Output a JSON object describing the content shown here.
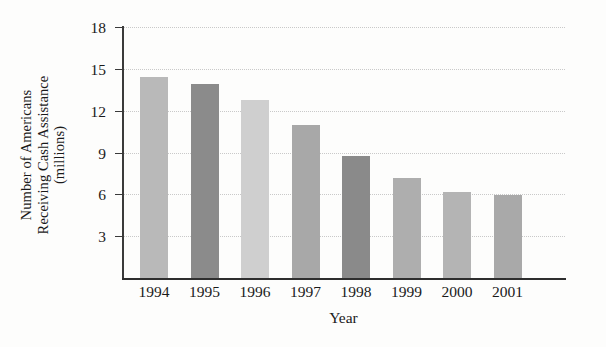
{
  "chart_data": {
    "type": "bar",
    "title": "",
    "xlabel": "Year",
    "ylabel": "Number of Americans Receiving Cash Assistance (millions)",
    "ylabel_lines": [
      "Number of Americans",
      "Receiving Cash Assistance",
      "(millions)"
    ],
    "categories": [
      "1994",
      "1995",
      "1996",
      "1997",
      "1998",
      "1999",
      "2000",
      "2001"
    ],
    "values": [
      14.4,
      13.9,
      12.8,
      11.0,
      8.75,
      7.2,
      6.2,
      5.95
    ],
    "ylim": [
      0,
      18
    ],
    "yticks": [
      3,
      6,
      9,
      12,
      15,
      18
    ],
    "ytick_labels": [
      "3",
      "6",
      "9",
      "12",
      "15",
      "18"
    ],
    "grid": true,
    "legend": "none",
    "bar_colors": [
      "#b9b9b9",
      "#8b8b8b",
      "#cfcfcf",
      "#a8a8a8",
      "#8a8a8a",
      "#aeaeae",
      "#b4b4b4",
      "#a9a9a9"
    ]
  },
  "colors": {
    "axis": "#2e2e2e",
    "gridline": "#c9c9c9",
    "background": "#fdfdfc",
    "text": "#1a1a1a"
  }
}
